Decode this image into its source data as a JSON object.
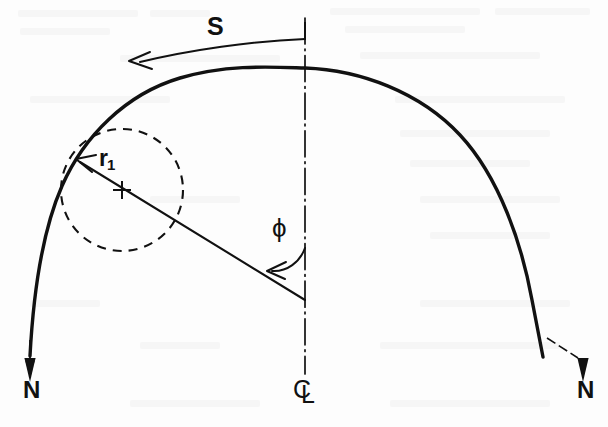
{
  "figure": {
    "kind": "engineering-line-diagram",
    "background_color": "#fdfdfd",
    "ink_color": "#111111"
  },
  "labels": {
    "arc_length": "S",
    "radius": "r",
    "radius_subscript": "1",
    "angle": "ϕ",
    "normal_left": "N",
    "normal_right": "N",
    "centerline_c": "C",
    "centerline_l": "L"
  },
  "geometry": {
    "centerline_x": 305,
    "apex": {
      "x": 305,
      "y": 68
    },
    "circle_center": {
      "x": 122,
      "y": 190
    },
    "circle_radius": 61,
    "tangent_point": {
      "x": 75,
      "y": 158
    },
    "radius_line_end": {
      "x": 305,
      "y": 300
    },
    "angle_vertex": {
      "x": 305,
      "y": 300
    },
    "left_support": {
      "x": 30,
      "y": 355
    },
    "right_support": {
      "x": 583,
      "y": 355
    },
    "s_arc_start": {
      "x": 305,
      "y": 39
    },
    "s_arc_end": {
      "x": 128,
      "y": 58
    }
  },
  "line_styles": {
    "profile": "solid",
    "centerline": "dash-dot",
    "osculating_circle": "dashed",
    "radius_leader": "solid",
    "arc_length_leader": "solid"
  }
}
